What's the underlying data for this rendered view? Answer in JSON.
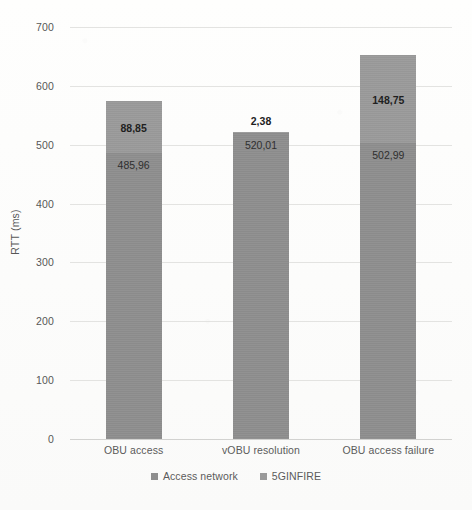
{
  "chart_data": {
    "type": "bar",
    "subtype": "stacked-column",
    "title": "",
    "xlabel": "",
    "ylabel": "RTT (ms)",
    "ylim": [
      0,
      700
    ],
    "ytick_step": 100,
    "yticks": [
      "700",
      "600",
      "500",
      "400",
      "300",
      "200",
      "100",
      "0"
    ],
    "grid": true,
    "legend_position": "bottom",
    "categories": [
      "OBU access",
      "vOBU resolution",
      "OBU access failure"
    ],
    "series": [
      {
        "name": "Access network",
        "color": "#8e8e8e",
        "values": [
          485.96,
          520.01,
          502.99
        ],
        "labels": [
          "485,96",
          "520,01",
          "502,99"
        ]
      },
      {
        "name": "5GINFIRE",
        "color": "#9a9a9a",
        "values": [
          88.85,
          2.38,
          148.75
        ],
        "labels": [
          "88,85",
          "2,38",
          "148,75"
        ]
      }
    ],
    "totals": [
      574.81,
      522.39,
      651.74
    ]
  },
  "axis": {
    "y_title": "RTT (ms)"
  },
  "legend": {
    "items": [
      {
        "label": "Access network",
        "color": "#8e8e8e"
      },
      {
        "label": "5GINFIRE",
        "color": "#9a9a9a"
      }
    ]
  }
}
